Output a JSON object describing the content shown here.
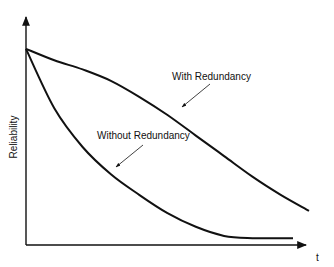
{
  "chart_data": {
    "type": "line",
    "title": "",
    "xlabel": "t",
    "ylabel": "Reliability",
    "ylim": [
      0,
      1
    ],
    "xlim": [
      0,
      1
    ],
    "grid": false,
    "legend_position": "inline annotations with arrows",
    "x": [
      0,
      0.1,
      0.2,
      0.3,
      0.4,
      0.5,
      0.6,
      0.7,
      0.8,
      0.9,
      1.0
    ],
    "series": [
      {
        "name": "With Redundancy",
        "values": [
          0.86,
          0.81,
          0.77,
          0.72,
          0.65,
          0.57,
          0.48,
          0.39,
          0.3,
          0.22,
          0.15
        ]
      },
      {
        "name": "Without Redundancy",
        "values": [
          0.86,
          0.6,
          0.43,
          0.31,
          0.22,
          0.14,
          0.08,
          0.04,
          0.03,
          0.03,
          null
        ]
      }
    ],
    "annotations": [
      {
        "text": "With Redundancy",
        "points_to": "With Redundancy curve"
      },
      {
        "text": "Without Redundancy",
        "points_to": "Without Redundancy curve"
      }
    ]
  },
  "labels": {
    "y_axis": "Reliability",
    "x_axis": "t",
    "with": "With Redundancy",
    "without": "Without Redundancy"
  },
  "colors": {
    "ink": "#111111",
    "background": "#ffffff"
  }
}
